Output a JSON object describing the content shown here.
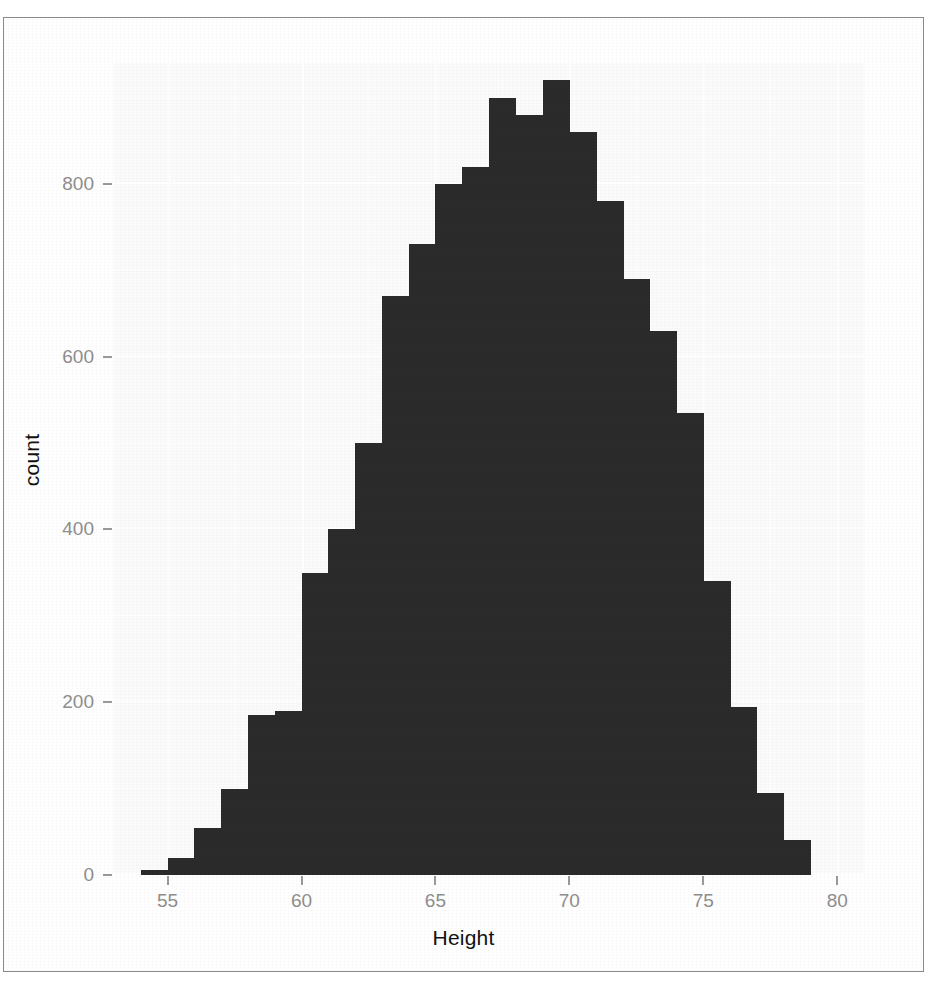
{
  "figure": {
    "background_color": "#ffffff",
    "panel_color": "#fbfbfb",
    "bar_color": "#2b2b2b",
    "gridline_color": "#ffffff",
    "axis_text_color": "#8e8e8e",
    "axis_title_color": "#121212",
    "frame_color": "#8a8a8a"
  },
  "axes": {
    "x_title": "Height",
    "y_title": "count",
    "x_ticks": [
      "55",
      "60",
      "65",
      "70",
      "75",
      "80"
    ],
    "y_ticks": [
      "0",
      "200",
      "400",
      "600",
      "800"
    ]
  },
  "chart_data": {
    "type": "bar",
    "title": "",
    "subtitle": "",
    "xlabel": "Height",
    "ylabel": "count",
    "xlim": [
      53,
      81
    ],
    "ylim": [
      0,
      940
    ],
    "grid": true,
    "legend": null,
    "bin_width": 1,
    "x_tick_values": [
      55,
      60,
      65,
      70,
      75,
      80
    ],
    "y_tick_values": [
      0,
      200,
      400,
      600,
      800
    ],
    "bin_centers": [
      54.5,
      55.5,
      56.5,
      57.5,
      58.5,
      59.5,
      60.5,
      61.5,
      62.5,
      63.5,
      64.5,
      65.5,
      66.5,
      67.5,
      68.5,
      69.5,
      70.5,
      71.5,
      72.5,
      73.5,
      74.5,
      75.5,
      76.5,
      77.5,
      78.5
    ],
    "categories": [
      "54-55",
      "55-56",
      "56-57",
      "57-58",
      "58-59",
      "59-60",
      "60-61",
      "61-62",
      "62-63",
      "63-64",
      "64-65",
      "65-66",
      "66-67",
      "67-68",
      "68-69",
      "69-70",
      "70-71",
      "71-72",
      "72-73",
      "73-74",
      "74-75",
      "75-76",
      "76-77",
      "77-78",
      "78-79"
    ],
    "values": [
      6,
      20,
      55,
      100,
      185,
      190,
      350,
      400,
      500,
      670,
      730,
      800,
      820,
      900,
      880,
      920,
      860,
      780,
      690,
      630,
      535,
      340,
      195,
      95,
      40
    ]
  }
}
